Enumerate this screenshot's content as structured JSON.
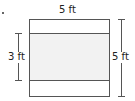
{
  "figure": {
    "top_label": "5 ft",
    "left_label": "3 ft",
    "right_label": "5 ft",
    "colors": {
      "stroke": "#555555",
      "band_fill": "#f2f2f2",
      "background": "#ffffff"
    }
  }
}
